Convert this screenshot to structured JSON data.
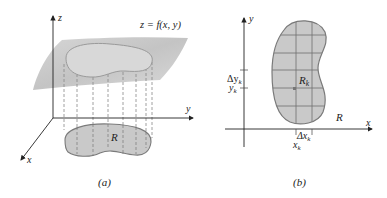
{
  "figure": {
    "panel_a": {
      "caption": "(a)",
      "axis_labels": {
        "x": "x",
        "y": "y",
        "z": "z"
      },
      "surface_label": "z = f(x, y)",
      "region_label": "R"
    },
    "panel_b": {
      "caption": "(b)",
      "axis_labels": {
        "x": "x",
        "y": "y"
      },
      "region_label": "R",
      "subregion_label": "R",
      "subregion_subscript": "k",
      "delta_y_label": "Δy",
      "delta_y_subscript": "k",
      "y_label": "y",
      "y_subscript": "k",
      "delta_x_label": "Δx",
      "delta_x_subscript": "k",
      "x_label": "x",
      "x_subscript": "k"
    },
    "colors": {
      "surface": "#c8c8c8",
      "region_fill": "#c9c9c9",
      "region_stroke": "#7a7a7a",
      "axis": "#222222",
      "grid": "#6e6e6e"
    }
  }
}
